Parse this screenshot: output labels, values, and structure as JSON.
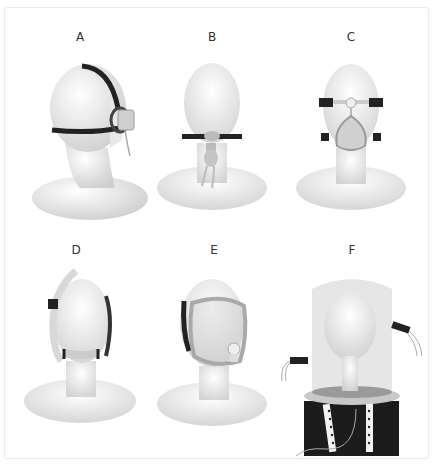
{
  "figure": {
    "panels": [
      {
        "label": "A",
        "device": "nasal mask",
        "view": "side"
      },
      {
        "label": "B",
        "device": "nasal pillows / oral interface",
        "view": "front"
      },
      {
        "label": "C",
        "device": "oronasal (full face) mask",
        "view": "front"
      },
      {
        "label": "D",
        "device": "nasal cushion with top-of-head tubing",
        "view": "front"
      },
      {
        "label": "E",
        "device": "total face mask",
        "view": "three-quarter"
      },
      {
        "label": "F",
        "device": "helmet",
        "view": "three-quarter"
      }
    ]
  },
  "colors": {
    "background": "#ffffff",
    "mannequin": "#ececec",
    "strap": "#222222",
    "mask": "#bdbdbd",
    "helmet": "#dcdcdc"
  }
}
